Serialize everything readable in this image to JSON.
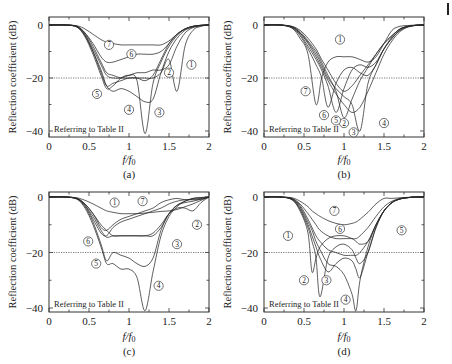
{
  "figure": {
    "panels": [
      "(a)",
      "(b)",
      "(c)",
      "(d)"
    ],
    "ylabel": "Reflection coefficient (dB)",
    "xlabel": "f/f0",
    "note": "Referring to Table II",
    "xticks": [
      "0",
      "0.5",
      "1",
      "1.5",
      "2"
    ],
    "yticks": [
      "0",
      "−20",
      "−40"
    ],
    "threshold_db": -20
  },
  "chart_data": [
    {
      "type": "line",
      "panel": "(a)",
      "xlabel": "f/f0",
      "ylabel": "Reflection coefficient (dB)",
      "xlim": [
        0,
        2
      ],
      "ylim": [
        -42,
        2
      ],
      "annotation": "Referring to Table II",
      "reference_line": {
        "y": -20,
        "style": "dotted"
      },
      "x": [
        0,
        0.2,
        0.35,
        0.45,
        0.55,
        0.65,
        0.72,
        0.8,
        0.9,
        1.0,
        1.1,
        1.2,
        1.3,
        1.4,
        1.5,
        1.6,
        1.7,
        1.8,
        1.9,
        2.0
      ],
      "series": [
        {
          "name": "1",
          "values": [
            0,
            0,
            -0.5,
            -3,
            -8,
            -14,
            -18,
            -19,
            -20,
            -20,
            -20,
            -20,
            -20,
            -18,
            -13,
            -25,
            -8,
            -2,
            -0.5,
            0
          ]
        },
        {
          "name": "2",
          "values": [
            0,
            0,
            -0.6,
            -3.5,
            -9,
            -15,
            -19,
            -20,
            -20,
            -19,
            -18,
            -18,
            -17,
            -17,
            -15,
            -8,
            -3,
            -1,
            -0.3,
            0
          ]
        },
        {
          "name": "3",
          "values": [
            0,
            0,
            -0.7,
            -4,
            -10,
            -17,
            -23,
            -25,
            -24,
            -25,
            -27,
            -29,
            -28,
            -18,
            -10,
            -5,
            -2,
            -0.8,
            -0.2,
            0
          ]
        },
        {
          "name": "4",
          "values": [
            0,
            0,
            -0.8,
            -4.5,
            -11,
            -19,
            -24,
            -23,
            -20,
            -19,
            -21,
            -41,
            -22,
            -14,
            -8,
            -4,
            -1.5,
            -0.6,
            -0.1,
            0
          ]
        },
        {
          "name": "5",
          "values": [
            0,
            0,
            -0.7,
            -4,
            -10,
            -18,
            -23,
            -22,
            -21,
            -20,
            -20,
            -21,
            -19,
            -13,
            -7,
            -3.5,
            -1.5,
            -0.5,
            -0.1,
            0
          ]
        },
        {
          "name": "6",
          "values": [
            0,
            0,
            -0.5,
            -3,
            -7,
            -12,
            -14,
            -14,
            -13,
            -12,
            -11,
            -11,
            -11,
            -10,
            -7,
            -3.5,
            -1.5,
            -0.5,
            -0.1,
            0
          ]
        },
        {
          "name": "7",
          "values": [
            0,
            0,
            -0.3,
            -1.5,
            -3.5,
            -5.5,
            -6.5,
            -7,
            -7.5,
            -7.5,
            -7.5,
            -7.5,
            -7.5,
            -7.5,
            -6,
            -3.5,
            -1.5,
            -0.5,
            -0.1,
            0
          ]
        }
      ]
    },
    {
      "type": "line",
      "panel": "(b)",
      "xlabel": "f/f0",
      "ylabel": "Reflection coefficient (dB)",
      "xlim": [
        0,
        2
      ],
      "ylim": [
        -42,
        2
      ],
      "annotation": "Referring to Table II",
      "reference_line": {
        "y": -20,
        "style": "dotted"
      },
      "x": [
        0,
        0.2,
        0.35,
        0.45,
        0.55,
        0.65,
        0.72,
        0.8,
        0.9,
        1.0,
        1.1,
        1.2,
        1.3,
        1.4,
        1.5,
        1.6,
        1.7,
        1.8,
        1.9,
        2.0
      ],
      "series": [
        {
          "name": "1",
          "values": [
            0,
            0,
            -0.5,
            -2,
            -5,
            -9,
            -13,
            -17,
            -22,
            -25,
            -23,
            -19,
            -15,
            -11,
            -7,
            -4,
            -1.5,
            -0.5,
            -0.1,
            0
          ]
        },
        {
          "name": "2",
          "values": [
            0,
            0,
            -0.6,
            -2.5,
            -6,
            -10,
            -14,
            -19,
            -25,
            -35,
            -28,
            -21,
            -16,
            -11,
            -7,
            -4,
            -1.5,
            -0.5,
            -0.1,
            0
          ]
        },
        {
          "name": "3",
          "values": [
            0,
            0,
            -0.7,
            -3,
            -6.5,
            -11,
            -15,
            -20,
            -24,
            -27,
            -30,
            -40,
            -22,
            -15,
            -9,
            -5,
            -2,
            -0.6,
            -0.1,
            0
          ]
        },
        {
          "name": "4",
          "values": [
            0,
            0,
            -0.8,
            -3,
            -7,
            -12,
            -16,
            -21,
            -26,
            -30,
            -33,
            -31,
            -25,
            -18,
            -11,
            -6,
            -2.5,
            -0.8,
            -0.2,
            0
          ]
        },
        {
          "name": "5",
          "values": [
            0,
            0,
            -0.9,
            -3.5,
            -8,
            -13,
            -17,
            -23,
            -33,
            -24,
            -17,
            -15,
            -16,
            -14,
            -9,
            -5,
            -2,
            -0.6,
            -0.1,
            0
          ]
        },
        {
          "name": "6",
          "values": [
            0,
            0,
            -1,
            -4,
            -9,
            -15,
            -20,
            -31,
            -22,
            -17,
            -16,
            -18,
            -19,
            -15,
            -9,
            -4.5,
            -1.5,
            -0.5,
            -0.1,
            0
          ]
        },
        {
          "name": "7",
          "values": [
            0,
            0,
            -1.2,
            -5,
            -11,
            -30,
            -20,
            -14,
            -12,
            -12,
            -12,
            -13,
            -14,
            -12,
            -7,
            -2,
            -0.5,
            -0.2,
            0,
            0
          ]
        }
      ]
    },
    {
      "type": "line",
      "panel": "(c)",
      "xlabel": "f/f0",
      "ylabel": "Reflection coefficient (dB)",
      "xlim": [
        0,
        2
      ],
      "ylim": [
        -42,
        2
      ],
      "annotation": "Referring to Table II",
      "reference_line": {
        "y": -20,
        "style": "dotted"
      },
      "x": [
        0,
        0.2,
        0.35,
        0.45,
        0.55,
        0.65,
        0.72,
        0.8,
        0.9,
        1.0,
        1.1,
        1.2,
        1.3,
        1.4,
        1.5,
        1.6,
        1.7,
        1.8,
        1.9,
        2.0
      ],
      "series": [
        {
          "name": "1",
          "values": [
            0,
            0,
            -0.3,
            -1.2,
            -2.5,
            -4,
            -5,
            -5.5,
            -6,
            -6,
            -6,
            -5.8,
            -5.5,
            -5.2,
            -5,
            -4.5,
            -3.5,
            -2.5,
            -1.2,
            0
          ]
        },
        {
          "name": "2",
          "values": [
            0,
            0,
            -0.5,
            -2.5,
            -6,
            -10,
            -12,
            -14,
            -14,
            -14,
            -14,
            -14,
            -13,
            -10,
            -6,
            -4,
            -4,
            -5,
            -2,
            0
          ]
        },
        {
          "name": "3",
          "values": [
            0,
            0,
            -0.6,
            -3,
            -7,
            -12,
            -14.5,
            -14,
            -14,
            -14,
            -14,
            -14,
            -14,
            -11,
            -6,
            -3,
            -2,
            -1.5,
            -0.8,
            0
          ]
        },
        {
          "name": "4",
          "values": [
            0,
            0,
            -0.8,
            -4,
            -10,
            -18,
            -24,
            -24,
            -26,
            -26,
            -29,
            -41,
            -27,
            -14,
            -7,
            -3.5,
            -1.5,
            -0.5,
            -0.2,
            0
          ]
        },
        {
          "name": "5",
          "values": [
            0,
            0,
            -0.7,
            -3.5,
            -9,
            -17,
            -23,
            -20,
            -21,
            -22,
            -24,
            -25,
            -22,
            -12,
            -6,
            -3,
            -1.5,
            -0.5,
            -0.2,
            0
          ]
        },
        {
          "name": "6",
          "values": [
            0,
            0,
            -0.6,
            -3,
            -8,
            -13,
            -14,
            -11,
            -9,
            -8,
            -7,
            -6,
            -5,
            -4,
            -2.5,
            -1.5,
            -1,
            -1,
            -0.8,
            0
          ]
        },
        {
          "name": "7",
          "values": [
            0,
            0,
            -0.5,
            -2.5,
            -6,
            -11,
            -12,
            -10,
            -8,
            -7,
            -6,
            -5,
            -4,
            -2,
            -1,
            -0.5,
            -1,
            -0.8,
            -0.5,
            0
          ]
        }
      ]
    },
    {
      "type": "line",
      "panel": "(d)",
      "xlabel": "f/f0",
      "ylabel": "Reflection coefficient (dB)",
      "xlim": [
        0,
        2
      ],
      "ylim": [
        -42,
        2
      ],
      "annotation": "Referring to Table II",
      "reference_line": {
        "y": -20,
        "style": "dotted"
      },
      "x": [
        0,
        0.2,
        0.35,
        0.45,
        0.55,
        0.6,
        0.65,
        0.7,
        0.8,
        0.9,
        1.0,
        1.1,
        1.15,
        1.2,
        1.3,
        1.4,
        1.5,
        1.6,
        1.7,
        1.8,
        1.9,
        2.0
      ],
      "series": [
        {
          "name": "1",
          "values": [
            0,
            0,
            -1,
            -5,
            -13,
            -27,
            -22,
            -18,
            -15,
            -14,
            -14,
            -15,
            -16,
            -17,
            -16,
            -10,
            -5,
            -2,
            -0.7,
            -0.2,
            0,
            0
          ]
        },
        {
          "name": "2",
          "values": [
            0,
            0,
            -0.9,
            -4.5,
            -11,
            -16,
            -22,
            -36,
            -22,
            -18,
            -17,
            -19,
            -22,
            -24,
            -20,
            -11,
            -5,
            -2,
            -0.7,
            -0.2,
            0,
            0
          ]
        },
        {
          "name": "3",
          "values": [
            0,
            0,
            -0.8,
            -4,
            -10,
            -14,
            -18,
            -22,
            -27,
            -24,
            -22,
            -23,
            -26,
            -29,
            -20,
            -11,
            -5,
            -2,
            -0.7,
            -0.2,
            0,
            0
          ]
        },
        {
          "name": "4",
          "values": [
            0,
            0,
            -0.7,
            -3.5,
            -9,
            -12,
            -16,
            -19,
            -24,
            -25,
            -28,
            -35,
            -41,
            -30,
            -18,
            -10,
            -5,
            -2,
            -0.7,
            -0.2,
            0,
            0
          ]
        },
        {
          "name": "5",
          "values": [
            0,
            0,
            -0.6,
            -3,
            -8,
            -11,
            -14,
            -16,
            -19,
            -20,
            -21,
            -21,
            -21,
            -20,
            -16,
            -10,
            -5,
            -2,
            -0.7,
            -0.2,
            0,
            0
          ]
        },
        {
          "name": "6",
          "values": [
            0,
            0,
            -0.5,
            -2.5,
            -6,
            -8,
            -10,
            -12,
            -14,
            -15,
            -15,
            -15,
            -15,
            -14,
            -11,
            -7,
            -3.5,
            -1.5,
            -0.5,
            -0.2,
            0,
            0
          ]
        },
        {
          "name": "7",
          "values": [
            0,
            0,
            -0.3,
            -1.5,
            -3.5,
            -5,
            -6,
            -7,
            -8.5,
            -9.5,
            -10,
            -9.5,
            -9,
            -8,
            -5.5,
            -2.5,
            -0.5,
            -0.5,
            -0.3,
            -0.1,
            0,
            0
          ]
        }
      ]
    }
  ],
  "labels": {
    "a": [
      {
        "n": "1",
        "x": 1.78,
        "y": -15
      },
      {
        "n": "2",
        "x": 1.5,
        "y": -18
      },
      {
        "n": "3",
        "x": 1.38,
        "y": -33
      },
      {
        "n": "4",
        "x": 1.0,
        "y": -32
      },
      {
        "n": "5",
        "x": 0.6,
        "y": -26
      },
      {
        "n": "6",
        "x": 1.03,
        "y": -11
      },
      {
        "n": "7",
        "x": 0.75,
        "y": -7.5
      }
    ],
    "b": [
      {
        "n": "1",
        "x": 0.95,
        "y": -5.5
      },
      {
        "n": "2",
        "x": 1.0,
        "y": -37
      },
      {
        "n": "3",
        "x": 1.12,
        "y": -40.5
      },
      {
        "n": "4",
        "x": 1.5,
        "y": -37
      },
      {
        "n": "5",
        "x": 0.9,
        "y": -36
      },
      {
        "n": "6",
        "x": 0.75,
        "y": -34
      },
      {
        "n": "7",
        "x": 0.52,
        "y": -25
      }
    ],
    "c": [
      {
        "n": "1",
        "x": 0.82,
        "y": -2
      },
      {
        "n": "2",
        "x": 1.85,
        "y": -10
      },
      {
        "n": "3",
        "x": 1.6,
        "y": -17
      },
      {
        "n": "4",
        "x": 1.37,
        "y": -32
      },
      {
        "n": "5",
        "x": 0.59,
        "y": -24
      },
      {
        "n": "6",
        "x": 0.49,
        "y": -16
      },
      {
        "n": "7",
        "x": 1.17,
        "y": -1.5
      }
    ],
    "d": [
      {
        "n": "1",
        "x": 0.3,
        "y": -14
      },
      {
        "n": "2",
        "x": 0.5,
        "y": -30
      },
      {
        "n": "3",
        "x": 0.78,
        "y": -30
      },
      {
        "n": "4",
        "x": 1.02,
        "y": -37
      },
      {
        "n": "5",
        "x": 1.72,
        "y": -12
      },
      {
        "n": "6",
        "x": 0.95,
        "y": -11.5
      },
      {
        "n": "7",
        "x": 0.88,
        "y": -5
      }
    ]
  }
}
